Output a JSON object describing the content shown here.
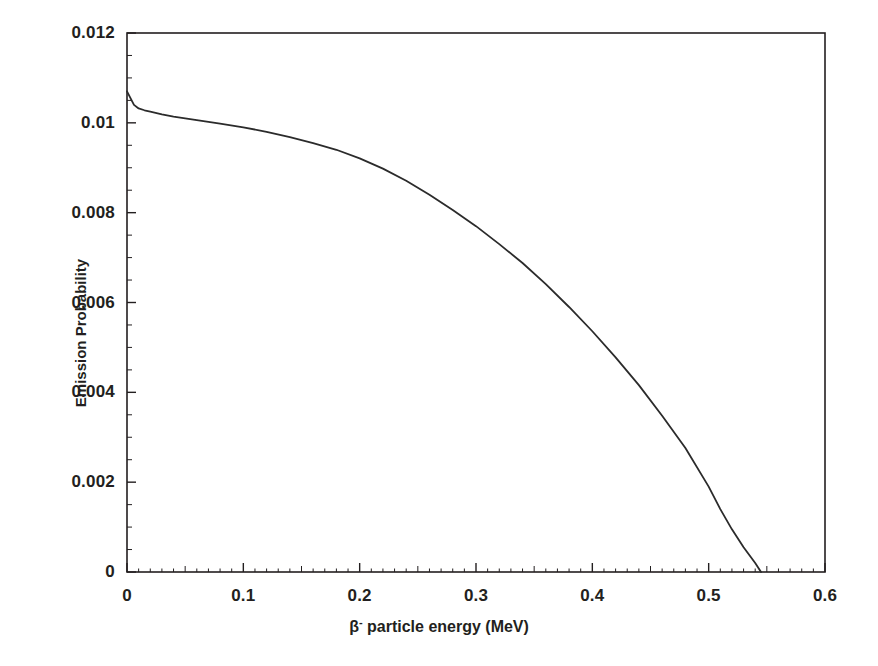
{
  "chart_data": {
    "type": "line",
    "title": "",
    "xlabel": "β⁻ particle energy (MeV)",
    "xlabel_base": "β",
    "xlabel_sup": "-",
    "xlabel_rest": " particle energy (MeV)",
    "ylabel": "Emission Probability",
    "xlim": [
      0,
      0.6
    ],
    "ylim": [
      0,
      0.012
    ],
    "grid": false,
    "legend": "none",
    "xticks": [
      "0",
      "0.1",
      "0.2",
      "0.3",
      "0.4",
      "0.5",
      "0.6"
    ],
    "xtick_values": [
      0,
      0.1,
      0.2,
      0.3,
      0.4,
      0.5,
      0.6
    ],
    "yticks": [
      "0",
      "0.002",
      "0.004",
      "0.006",
      "0.008",
      "0.01",
      "0.012"
    ],
    "ytick_values": [
      0,
      0.002,
      0.004,
      0.006,
      0.008,
      0.01,
      0.012
    ],
    "x_minor_tick_step": 0.01,
    "y_minor_tick_step": 0.0005,
    "line_color": "#2b2b2b",
    "line_width": 1.8,
    "axis_color": "#231f20",
    "background_color": "#ffffff",
    "series": [
      {
        "name": "beta-minus emission spectrum",
        "x": [
          0.0,
          0.003,
          0.006,
          0.01,
          0.015,
          0.02,
          0.03,
          0.04,
          0.05,
          0.06,
          0.08,
          0.1,
          0.12,
          0.14,
          0.16,
          0.18,
          0.2,
          0.22,
          0.24,
          0.26,
          0.28,
          0.3,
          0.32,
          0.34,
          0.36,
          0.38,
          0.4,
          0.42,
          0.44,
          0.46,
          0.48,
          0.5,
          0.51,
          0.52,
          0.53,
          0.54,
          0.545
        ],
        "y": [
          0.0107,
          0.01055,
          0.0104,
          0.01032,
          0.01028,
          0.01025,
          0.01019,
          0.01014,
          0.0101,
          0.01006,
          0.00998,
          0.0099,
          0.0098,
          0.00968,
          0.00955,
          0.0094,
          0.00921,
          0.00898,
          0.00871,
          0.0084,
          0.00806,
          0.0077,
          0.0073,
          0.00688,
          0.00641,
          0.0059,
          0.00536,
          0.00478,
          0.00416,
          0.00348,
          0.00276,
          0.0019,
          0.0014,
          0.00095,
          0.00055,
          0.0002,
          0.0
        ]
      }
    ]
  },
  "geometry": {
    "plot_left": 127,
    "plot_right": 825,
    "plot_top": 33,
    "plot_bottom": 572
  }
}
